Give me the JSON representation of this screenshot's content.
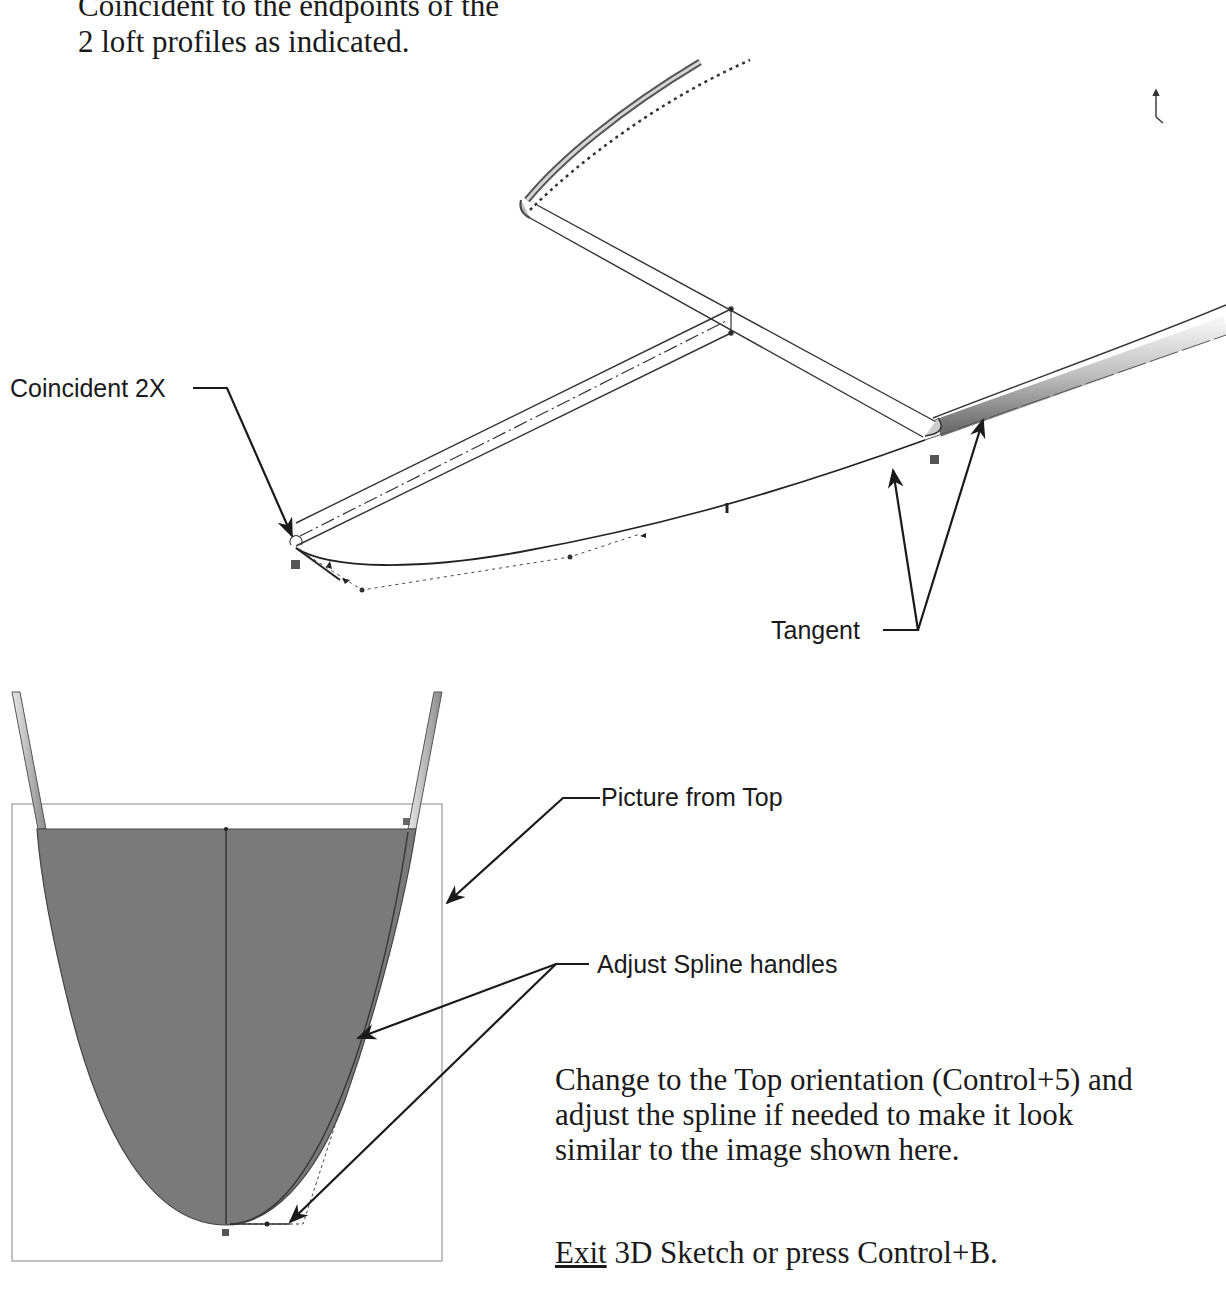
{
  "intro": {
    "line1": "Coincident to the endpoints of the",
    "line2": "2 loft profiles as indicated."
  },
  "figure_3d": {
    "callouts": {
      "coincident": "Coincident 2X",
      "tangent": "Tangent"
    }
  },
  "figure_top": {
    "callouts": {
      "picture_from_top": "Picture from Top",
      "adjust_handles": "Adjust Spline handles"
    },
    "fill_color": "#7a7a7a",
    "frame_color": "#9a9a9a"
  },
  "instructions": {
    "step1": {
      "line1": "Change to the Top orientation (Control+5) and",
      "line2": "adjust the spline if needed to make it look",
      "line3": "similar to the image shown here."
    },
    "step2": {
      "exit_word": "Exit",
      "rest": " 3D Sketch or press Control+B."
    }
  }
}
